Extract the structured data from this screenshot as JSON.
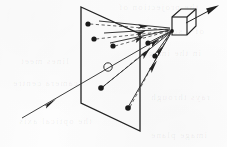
{
  "figure": {
    "caption": "",
    "medium": "scanned line drawing, grayscale on off-white paper",
    "background_color": "#fdfdfd",
    "ink_color": "#222222",
    "ink_color_light": "#555555",
    "width": 227,
    "height": 147
  },
  "elements": {
    "image_plane": {
      "label": "image plane",
      "shape": "parallelogram",
      "stroke": "#222222",
      "stroke_width": 1.3,
      "points": "81,7 140,34 140,131 81,103"
    },
    "camera": {
      "label": "camera cube",
      "shape": "isometric cube",
      "stroke": "#222222",
      "stroke_width": 1.2,
      "outline": "172,17 181,9 196,9 196,26 187,35 172,35",
      "front_top_left": "172,17",
      "front_top_right": "187,17",
      "inner_vertical": "187,17 187,35",
      "inner_top_right": "187,17 196,9",
      "inner_left_top": "172,17 181,9",
      "center_of_projection": "172,31"
    },
    "principal_point": {
      "label": "principal point",
      "symbol": "small hollow circle",
      "cx": 108,
      "cy": 67,
      "r": 4.2,
      "stroke": "#333333"
    },
    "optical_axis": {
      "label": "optical axis ray",
      "from": "22,118",
      "to": "172,31",
      "arrow_at": "50,102",
      "style": "solid"
    },
    "scene_points": [
      {
        "id": "p1",
        "cx": 88,
        "cy": 24,
        "r": 2.6
      },
      {
        "id": "p2",
        "cx": 94,
        "cy": 39,
        "r": 2.6
      },
      {
        "id": "p3",
        "cx": 113,
        "cy": 46,
        "r": 2.6
      },
      {
        "id": "p4",
        "cx": 148,
        "cy": 43,
        "r": 2.6
      },
      {
        "id": "p5",
        "cx": 155,
        "cy": 56,
        "r": 2.6
      },
      {
        "id": "p6",
        "cx": 101,
        "cy": 88,
        "r": 2.8
      },
      {
        "id": "p7",
        "cx": 128,
        "cy": 108,
        "r": 2.8
      }
    ],
    "solid_rays": [
      {
        "id": "r1",
        "from": "88,24",
        "to": "172,31",
        "arrow_at": "138,27"
      },
      {
        "id": "r2",
        "from": "94,39",
        "to": "172,31",
        "arrow_at": "139,35"
      },
      {
        "id": "r3",
        "from": "113,46",
        "to": "172,31",
        "arrow_at": "140,39"
      },
      {
        "id": "r4",
        "from": "148,43",
        "to": "172,31",
        "arrow_at": "152,41"
      },
      {
        "id": "r5",
        "from": "155,56",
        "to": "172,31",
        "arrow_at": "160,49"
      },
      {
        "id": "r6",
        "from": "101,88",
        "to": "172,31",
        "arrow_at": "146,53"
      },
      {
        "id": "r7",
        "from": "128,108",
        "to": "172,31",
        "arrow_at": "152,66"
      }
    ],
    "dashed_rays": [
      {
        "id": "d1",
        "from": "88,24",
        "to": "172,31"
      },
      {
        "id": "d2",
        "from": "94,39",
        "to": "172,31"
      },
      {
        "id": "d3",
        "from": "113,46",
        "to": "172,31"
      },
      {
        "id": "d4",
        "from": "101,88",
        "to": "172,31"
      },
      {
        "id": "d5",
        "from": "128,108",
        "to": "172,31"
      }
    ],
    "exit_arrow": {
      "label": "outgoing view direction",
      "from": "187,22",
      "to": "218,6",
      "arrow_at": "218,6",
      "style": "solid"
    }
  },
  "bleed_through_text": [
    {
      "text": "the projection of",
      "x": 118,
      "y": 6
    },
    {
      "text": "of a scene point",
      "x": 128,
      "y": 30
    },
    {
      "text": "in the image",
      "x": 142,
      "y": 52
    },
    {
      "text": "lines meet",
      "x": 26,
      "y": 60
    },
    {
      "text": "camera centre",
      "x": 18,
      "y": 82
    },
    {
      "text": "rays through",
      "x": 150,
      "y": 96
    },
    {
      "text": "the optical axis",
      "x": 24,
      "y": 120
    },
    {
      "text": "image plane",
      "x": 150,
      "y": 134
    }
  ]
}
